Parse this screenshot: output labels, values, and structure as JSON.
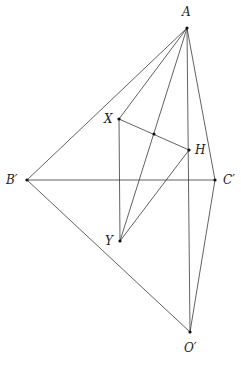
{
  "diagram": {
    "points": {
      "A": {
        "label": "A",
        "x": 187,
        "y": 28
      },
      "X": {
        "label": "X",
        "x": 119,
        "y": 119
      },
      "M": {
        "label": "",
        "x": 154,
        "y": 134
      },
      "H": {
        "label": "H",
        "x": 189,
        "y": 150
      },
      "Bp": {
        "label": "B′",
        "x": 27,
        "y": 180
      },
      "Cp": {
        "label": "C′",
        "x": 215,
        "y": 180
      },
      "Y": {
        "label": "Y",
        "x": 120,
        "y": 241
      },
      "Op": {
        "label": "O′",
        "x": 190,
        "y": 332
      }
    },
    "segments": [
      [
        "A",
        "Bp"
      ],
      [
        "A",
        "X"
      ],
      [
        "A",
        "Y"
      ],
      [
        "A",
        "Op"
      ],
      [
        "A",
        "Cp"
      ],
      [
        "X",
        "H"
      ],
      [
        "X",
        "Y"
      ],
      [
        "Y",
        "H"
      ],
      [
        "Bp",
        "Cp"
      ],
      [
        "Bp",
        "Op"
      ],
      [
        "Cp",
        "Op"
      ]
    ]
  }
}
